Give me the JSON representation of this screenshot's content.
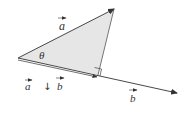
{
  "diagram": {
    "type": "vector-projection",
    "colors": {
      "line": "#333333",
      "fill": "#e6e6e6",
      "text": "#333333"
    },
    "points": {
      "origin": [
        18,
        58
      ],
      "a_tip": [
        114,
        9
      ],
      "foot": [
        98,
        75
      ],
      "b_tip": [
        177,
        93
      ]
    },
    "labels": {
      "vector_a": "a",
      "vector_b": "b",
      "angle": "θ",
      "projection_left": "a",
      "projection_symbol": "↓",
      "projection_right": "b"
    },
    "annotations": {
      "right_angle": true
    }
  }
}
